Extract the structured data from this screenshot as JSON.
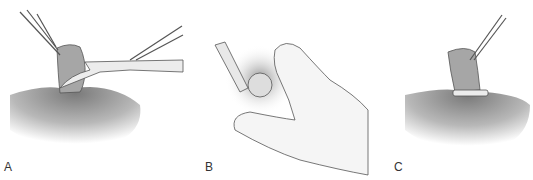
{
  "figure": {
    "panels": [
      {
        "id": "A",
        "label": "A",
        "description": "Forceps grasping tissue stump while scissors cut at base"
      },
      {
        "id": "B",
        "label": "B",
        "description": "Hand holding tissue with clamp/applicator tip"
      },
      {
        "id": "C",
        "label": "C",
        "description": "Forceps holding tissue with ligature band at base"
      }
    ],
    "colors": {
      "background": "#ffffff",
      "skin_shade": "#8a8a8a",
      "tissue": "#a8a8a8",
      "instrument": "#e8e8e8",
      "line": "#444444"
    }
  }
}
